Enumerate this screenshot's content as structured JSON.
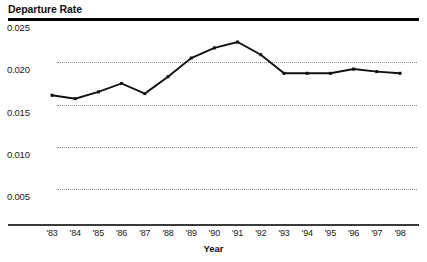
{
  "chart_data": {
    "type": "line",
    "title": "Departure Rate",
    "xlabel": "Year",
    "ylabel": "",
    "categories": [
      "'83",
      "'84",
      "'85",
      "'86",
      "'87",
      "'88",
      "'89",
      "'90",
      "'91",
      "'92",
      "'93",
      "'94",
      "'95",
      "'96",
      "'97",
      "'98"
    ],
    "values": [
      0.0161,
      0.0157,
      0.0165,
      0.0175,
      0.0163,
      0.0183,
      0.0205,
      0.0217,
      0.0224,
      0.0209,
      0.0187,
      0.0187,
      0.0187,
      0.0192,
      0.0189,
      0.0187
    ],
    "series": [
      {
        "name": "Departure Rate",
        "values": [
          0.0161,
          0.0157,
          0.0165,
          0.0175,
          0.0163,
          0.0183,
          0.0205,
          0.0217,
          0.0224,
          0.0209,
          0.0187,
          0.0187,
          0.0187,
          0.0192,
          0.0189,
          0.0187
        ]
      }
    ],
    "ylim": [
      0.0,
      0.025
    ],
    "xlim": [
      "'83",
      "'98"
    ],
    "yticks": [
      0.005,
      0.01,
      0.015,
      0.02,
      0.025
    ],
    "ytick_labels": [
      "0.005",
      "0.010",
      "0.015",
      "0.020",
      "0.025"
    ],
    "grid": true,
    "grid_style": "dotted-horizontal",
    "legend": false,
    "legend_position": "none",
    "marker": "small-square",
    "line_color": "#111111",
    "grid_color": "#8d8d8d",
    "background": "#ffffff"
  },
  "axes": {
    "y_title": "Departure Rate",
    "x_title": "Year"
  }
}
